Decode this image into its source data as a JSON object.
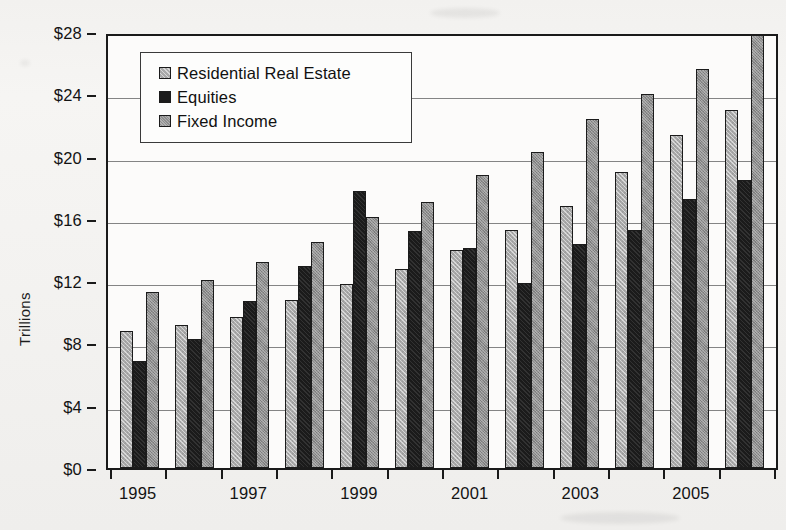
{
  "chart_data": {
    "type": "bar",
    "title": "",
    "xlabel": "",
    "ylabel": "Trillions",
    "ylim": [
      0,
      28
    ],
    "ytick_step": 4,
    "ytick_labels": [
      "$0",
      "$4",
      "$8",
      "$12",
      "$16",
      "$20",
      "$24",
      "$28"
    ],
    "grid": true,
    "legend_position": "upper-left-inside",
    "categories": [
      "1995",
      "1996",
      "1997",
      "1998",
      "1999",
      "2000",
      "2001",
      "2002",
      "2003",
      "2004",
      "2005",
      "2006"
    ],
    "visible_xtick_labels": [
      "1995",
      "1997",
      "1999",
      "2001",
      "2003",
      "2005"
    ],
    "series": [
      {
        "name": "Residential Real Estate",
        "color": "#a9a9a9",
        "values": [
          8.8,
          9.2,
          9.7,
          10.8,
          11.8,
          12.8,
          14.0,
          15.3,
          16.8,
          19.0,
          21.4,
          23.0
        ]
      },
      {
        "name": "Equities",
        "color": "#1b1b1b",
        "values": [
          6.9,
          8.3,
          10.7,
          13.0,
          17.8,
          15.2,
          14.1,
          11.9,
          14.4,
          15.3,
          17.3,
          18.5
        ]
      },
      {
        "name": "Fixed Income",
        "color": "#8e8e8e",
        "values": [
          11.3,
          12.1,
          13.2,
          14.5,
          16.1,
          17.1,
          18.8,
          20.3,
          22.4,
          24.0,
          25.6,
          27.8
        ]
      }
    ]
  },
  "legend": {
    "items": [
      {
        "label": "Residential Real Estate",
        "swatch": "rre"
      },
      {
        "label": "Equities",
        "swatch": "eq"
      },
      {
        "label": "Fixed Income",
        "swatch": "fi"
      }
    ]
  },
  "axis": {
    "y_title": "Trillions"
  }
}
